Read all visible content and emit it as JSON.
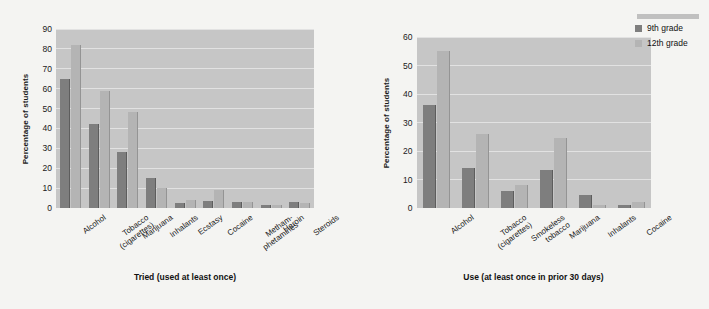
{
  "chart_data": [
    {
      "type": "bar",
      "title": "",
      "xlabel": "Tried (used at least once)",
      "ylabel": "Percentage of students",
      "ylim": [
        0,
        90
      ],
      "yticks": [
        0,
        10,
        20,
        30,
        40,
        50,
        60,
        70,
        80,
        90
      ],
      "grid": true,
      "legend": [
        "9th grade",
        "12th grade"
      ],
      "legend_position": "none",
      "categories": [
        "Alcohol",
        "Tobacco\n(cigarettes)",
        "Marijuana",
        "Inhalants",
        "Ecstasy",
        "Cocaine",
        "Metham-\nphetamines",
        "Heroin",
        "Steroids"
      ],
      "series": [
        {
          "name": "9th grade",
          "color": "#7e7e7e",
          "values": [
            65,
            42,
            28,
            15,
            2.5,
            3.5,
            3,
            1.5,
            3
          ]
        },
        {
          "name": "12th grade",
          "color": "#b4b4b4",
          "values": [
            82,
            59,
            48.5,
            10,
            4,
            9,
            3,
            1.5,
            2.5
          ]
        }
      ]
    },
    {
      "type": "bar",
      "title": "",
      "xlabel": "Use (at least once in prior 30 days)",
      "ylabel": "Percentage of students",
      "ylim": [
        0,
        60
      ],
      "yticks": [
        0,
        10,
        20,
        30,
        40,
        50,
        60
      ],
      "grid": true,
      "legend": [
        "9th grade",
        "12th grade"
      ],
      "legend_position": "top-right",
      "categories": [
        "Alcohol",
        "Tobacco\n(cigarettes)",
        "Smokeless\ntobacco",
        "Marijuana",
        "Inhalants",
        "Cocaine"
      ],
      "series": [
        {
          "name": "9th grade",
          "color": "#7e7e7e",
          "values": [
            36,
            14,
            6,
            13.5,
            4.5,
            1
          ]
        },
        {
          "name": "12th grade",
          "color": "#b4b4b4",
          "values": [
            55,
            26,
            8,
            24.5,
            1,
            2
          ]
        }
      ]
    }
  ],
  "colors": {
    "page_background": "#f4f4f2",
    "plot_background": "#c6c6c6",
    "gridline": "#e2e2e2",
    "series_9th": "#7e7e7e",
    "series_12th": "#b4b4b4",
    "text": "#1a1a1a"
  },
  "legend": {
    "series_9th_label": "9th grade",
    "series_12th_label": "12th grade"
  },
  "panels": {
    "left": {
      "ylabel": "Percentage of students",
      "xlabel": "Tried (used at least once)"
    },
    "right": {
      "ylabel": "Percentage of students",
      "xlabel": "Use (at least once in prior 30 days)"
    }
  }
}
